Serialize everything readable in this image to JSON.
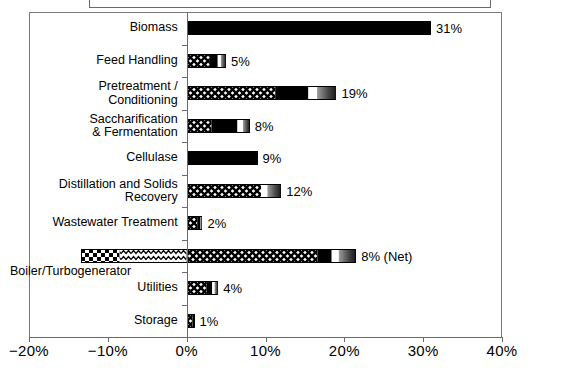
{
  "chart_data": {
    "type": "bar",
    "title": "",
    "xlabel": "",
    "ylabel": "",
    "orientation": "horizontal",
    "xlim": [
      -20,
      40
    ],
    "xticks": [
      -20,
      -10,
      0,
      10,
      20,
      30,
      40
    ],
    "xticklabels": [
      "-20%",
      "-10%",
      "0%",
      "10%",
      "20%",
      "30%",
      "40%"
    ],
    "grid": false,
    "legend": "none",
    "categories": [
      "Biomass",
      "Feed Handling",
      "Pretreatment /\nConditioning",
      "Saccharification\n& Fermentation",
      "Cellulase",
      "Distillation and Solids\nRecovery",
      "Wastewater Treatment",
      "Boiler/Turbogenerator",
      "Utilities",
      "Storage"
    ],
    "values": [
      31,
      5,
      19,
      8,
      9,
      12,
      2,
      8,
      4,
      1
    ],
    "value_labels": [
      "31%",
      "5%",
      "19%",
      "8%",
      "9%",
      "12%",
      "2%",
      "8% (Net)",
      "4%",
      "1%"
    ],
    "stacks": [
      [
        {
          "from": 0,
          "to": 31,
          "fill": "solid-black"
        }
      ],
      [
        {
          "from": 0,
          "to": 2.9,
          "fill": "crosshatch"
        },
        {
          "from": 2.9,
          "to": 3.9,
          "fill": "solid-black"
        },
        {
          "from": 3.9,
          "to": 4.3,
          "fill": "white"
        },
        {
          "from": 4.3,
          "to": 5.0,
          "fill": "gray-gradient"
        }
      ],
      [
        {
          "from": 0,
          "to": 11.2,
          "fill": "crosshatch"
        },
        {
          "from": 11.2,
          "to": 15.4,
          "fill": "solid-black"
        },
        {
          "from": 15.4,
          "to": 16.5,
          "fill": "white"
        },
        {
          "from": 16.5,
          "to": 19.0,
          "fill": "gray-gradient"
        }
      ],
      [
        {
          "from": 0,
          "to": 3.1,
          "fill": "crosshatch"
        },
        {
          "from": 3.1,
          "to": 6.4,
          "fill": "solid-black"
        },
        {
          "from": 6.4,
          "to": 7.1,
          "fill": "white"
        },
        {
          "from": 7.1,
          "to": 8.0,
          "fill": "gray-gradient"
        }
      ],
      [
        {
          "from": 0,
          "to": 9.0,
          "fill": "solid-black"
        }
      ],
      [
        {
          "from": 0,
          "to": 9.4,
          "fill": "crosshatch"
        },
        {
          "from": 9.4,
          "to": 10.2,
          "fill": "white"
        },
        {
          "from": 10.2,
          "to": 12.0,
          "fill": "gray-gradient"
        }
      ],
      [
        {
          "from": 0,
          "to": 1.3,
          "fill": "crosshatch"
        },
        {
          "from": 1.3,
          "to": 1.7,
          "fill": "solid-black"
        },
        {
          "from": 1.7,
          "to": 2.0,
          "fill": "gray-gradient"
        }
      ],
      [
        {
          "from": -13.4,
          "to": -8.5,
          "fill": "checkerboard"
        },
        {
          "from": -8.5,
          "to": 0,
          "fill": "wavy"
        },
        {
          "from": 0,
          "to": 16.6,
          "fill": "crosshatch"
        },
        {
          "from": 16.6,
          "to": 18.4,
          "fill": "solid-black"
        },
        {
          "from": 18.4,
          "to": 19.3,
          "fill": "white"
        },
        {
          "from": 19.3,
          "to": 21.5,
          "fill": "gray-gradient"
        }
      ],
      [
        {
          "from": 0,
          "to": 2.5,
          "fill": "crosshatch"
        },
        {
          "from": 2.5,
          "to": 3.2,
          "fill": "solid-black"
        },
        {
          "from": 3.2,
          "to": 3.5,
          "fill": "white"
        },
        {
          "from": 3.5,
          "to": 4.0,
          "fill": "gray-gradient"
        }
      ],
      [
        {
          "from": 0,
          "to": 0.7,
          "fill": "crosshatch"
        },
        {
          "from": 0.7,
          "to": 1.0,
          "fill": "solid-black"
        }
      ]
    ]
  },
  "colors": {
    "axis": "#6a6a6a",
    "bar_outline": "#000000",
    "fill_black": "#000000",
    "fill_white": "#ffffff",
    "fill_gray_light": "#b5b5b5",
    "fill_gray_dark": "#2a2a2a",
    "background": "#ffffff"
  }
}
